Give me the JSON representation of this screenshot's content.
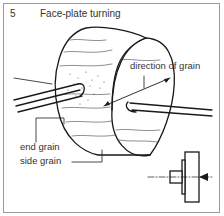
{
  "figure": {
    "number": "5",
    "title": "Face-plate turning"
  },
  "labels": {
    "direction": "direction of grain",
    "end_grain": "end grain",
    "side_grain": "side grain"
  },
  "colors": {
    "ink": "#1a1a1a",
    "text": "#333333",
    "border": "#9a9a9a"
  }
}
